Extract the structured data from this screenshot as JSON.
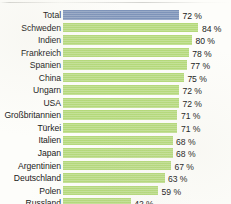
{
  "chart_data": {
    "type": "bar",
    "orientation": "horizontal",
    "title": "",
    "subtitle": "",
    "xlabel": "",
    "ylabel": "",
    "grid": false,
    "legend": null,
    "xlim": [
      0,
      100
    ],
    "unit": "%",
    "value_suffix": " %",
    "categories": [
      "Total",
      "Schweden",
      "Indien",
      "Frankreich",
      "Spanien",
      "China",
      "Ungarn",
      "USA",
      "Großbritannien",
      "Türkei",
      "Italien",
      "Japan",
      "Argentinien",
      "Deutschland",
      "Polen",
      "Russland"
    ],
    "values": [
      72,
      84,
      80,
      78,
      77,
      75,
      72,
      72,
      71,
      71,
      68,
      68,
      67,
      63,
      59,
      42
    ],
    "value_labels": [
      "72 %",
      "84 %",
      "80 %",
      "78 %",
      "77 %",
      "75 %",
      "72 %",
      "72 %",
      "71 %",
      "71 %",
      "68 %",
      "68 %",
      "67 %",
      "63 %",
      "59 %",
      "42 %"
    ],
    "highlight_index": 0,
    "colors": {
      "bar": "#b4d97a",
      "bar_highlight": "#7d93b9",
      "text": "#191919",
      "background": "#fdfdfa"
    }
  },
  "rows": [
    {
      "label": "Total",
      "value": 72,
      "value_label": "72 %",
      "highlight": true
    },
    {
      "label": "Schweden",
      "value": 84,
      "value_label": "84 %",
      "highlight": false
    },
    {
      "label": "Indien",
      "value": 80,
      "value_label": "80 %",
      "highlight": false
    },
    {
      "label": "Frankreich",
      "value": 78,
      "value_label": "78 %",
      "highlight": false
    },
    {
      "label": "Spanien",
      "value": 77,
      "value_label": "77 %",
      "highlight": false
    },
    {
      "label": "China",
      "value": 75,
      "value_label": "75 %",
      "highlight": false
    },
    {
      "label": "Ungarn",
      "value": 72,
      "value_label": "72 %",
      "highlight": false
    },
    {
      "label": "USA",
      "value": 72,
      "value_label": "72 %",
      "highlight": false
    },
    {
      "label": "Großbritannien",
      "value": 71,
      "value_label": "71 %",
      "highlight": false
    },
    {
      "label": "Türkei",
      "value": 71,
      "value_label": "71 %",
      "highlight": false
    },
    {
      "label": "Italien",
      "value": 68,
      "value_label": "68 %",
      "highlight": false
    },
    {
      "label": "Japan",
      "value": 68,
      "value_label": "68 %",
      "highlight": false
    },
    {
      "label": "Argentinien",
      "value": 67,
      "value_label": "67 %",
      "highlight": false
    },
    {
      "label": "Deutschland",
      "value": 63,
      "value_label": "63 %",
      "highlight": false
    },
    {
      "label": "Polen",
      "value": 59,
      "value_label": "59 %",
      "highlight": false
    },
    {
      "label": "Russland",
      "value": 42,
      "value_label": "42 %",
      "highlight": false
    }
  ]
}
